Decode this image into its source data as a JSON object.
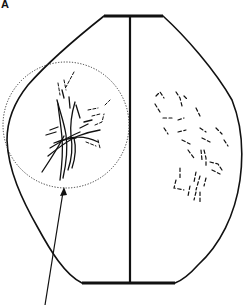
{
  "figure": {
    "panel_label": "A",
    "colors": {
      "stroke": "#111111",
      "background": "#ffffff"
    },
    "elements": {
      "outline": "hexagonal-ish rounded outline with flat top and bottom bars",
      "midline": "vertical line from top bar to bottom bar",
      "highlight_circle": "dotted circle around left branching structure",
      "arrow": "arrow pointing up to bottom of dotted circle",
      "left_pattern": "solid branching lines (tree-like)",
      "right_pattern": "scattered short dashes"
    }
  }
}
